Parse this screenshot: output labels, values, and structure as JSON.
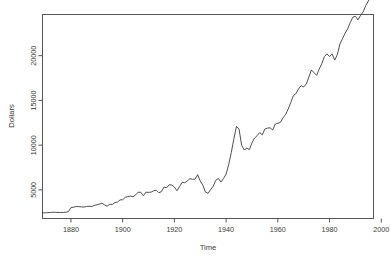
{
  "chart_data": {
    "type": "line",
    "title": "",
    "xlabel": "Time",
    "ylabel": "Dollars",
    "xlim": [
      1869,
      1997
    ],
    "ylim": [
      1800,
      24600
    ],
    "xticks": [
      1880,
      1900,
      1920,
      1940,
      1960,
      1980,
      2000
    ],
    "yticks": [
      5000,
      10000,
      15000,
      20000
    ],
    "xtick_labels": [
      "1880",
      "1900",
      "1920",
      "1940",
      "1960",
      "1980",
      "2000"
    ],
    "ytick_labels": [
      "5000",
      "10000",
      "15000",
      "20000"
    ],
    "grid": false,
    "legend": null,
    "series": [
      {
        "name": "Dollars",
        "color": "#3a3a3a",
        "x": [
          1869,
          1870,
          1871,
          1872,
          1873,
          1874,
          1875,
          1876,
          1877,
          1878,
          1879,
          1880,
          1881,
          1882,
          1883,
          1884,
          1885,
          1886,
          1887,
          1888,
          1889,
          1890,
          1891,
          1892,
          1893,
          1894,
          1895,
          1896,
          1897,
          1898,
          1899,
          1900,
          1901,
          1902,
          1903,
          1904,
          1905,
          1906,
          1907,
          1908,
          1909,
          1910,
          1911,
          1912,
          1913,
          1914,
          1915,
          1916,
          1917,
          1918,
          1919,
          1920,
          1921,
          1922,
          1923,
          1924,
          1925,
          1926,
          1927,
          1928,
          1929,
          1930,
          1931,
          1932,
          1933,
          1934,
          1935,
          1936,
          1937,
          1938,
          1939,
          1940,
          1941,
          1942,
          1943,
          1944,
          1945,
          1946,
          1947,
          1948,
          1949,
          1950,
          1951,
          1952,
          1953,
          1954,
          1955,
          1956,
          1957,
          1958,
          1959,
          1960,
          1961,
          1962,
          1963,
          1964,
          1965,
          1966,
          1967,
          1968,
          1969,
          1970,
          1971,
          1972,
          1973,
          1974,
          1975,
          1976,
          1977,
          1978,
          1979,
          1980,
          1981,
          1982,
          1983,
          1984,
          1985,
          1986,
          1987,
          1988,
          1989,
          1990,
          1991,
          1992,
          1993,
          1994,
          1995,
          1996
        ],
        "y": [
          2420,
          2440,
          2450,
          2470,
          2500,
          2490,
          2480,
          2470,
          2480,
          2500,
          2560,
          3010,
          3060,
          3140,
          3130,
          3100,
          3080,
          3140,
          3180,
          3130,
          3260,
          3330,
          3400,
          3520,
          3330,
          3180,
          3390,
          3370,
          3580,
          3640,
          3880,
          3890,
          4170,
          4240,
          4310,
          4230,
          4430,
          4740,
          4730,
          4340,
          4740,
          4720,
          4750,
          4900,
          4970,
          4680,
          4800,
          5320,
          5230,
          5580,
          5540,
          5310,
          4910,
          5360,
          5840,
          5800,
          6010,
          6250,
          6180,
          6200,
          6700,
          6000,
          5530,
          4760,
          4610,
          5020,
          5400,
          6060,
          6280,
          5870,
          6270,
          6760,
          7830,
          9180,
          10700,
          12100,
          11800,
          10000,
          9460,
          9660,
          9500,
          10250,
          10790,
          11060,
          11400,
          11150,
          11800,
          11900,
          11940,
          11690,
          12350,
          12450,
          12540,
          13040,
          13430,
          14030,
          14760,
          15520,
          15750,
          16280,
          16650,
          16500,
          16830,
          17600,
          18400,
          18100,
          17800,
          18500,
          19100,
          19900,
          20200,
          19900,
          20200,
          19500,
          20100,
          21300,
          21900,
          22500,
          23000,
          23700,
          24300,
          24400,
          24000,
          24500,
          24900,
          25600,
          26100,
          26700
        ]
      }
    ],
    "note_low": 2420,
    "note_peak_wwii": 12100,
    "note_end": 26700
  },
  "axes": {
    "y_title": "Dollars",
    "x_title": "Time"
  }
}
